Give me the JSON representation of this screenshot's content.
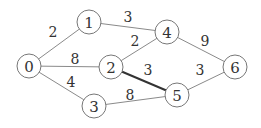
{
  "diagram": {
    "type": "weighted-undirected-graph",
    "nodes": [
      {
        "id": "0",
        "label": "0",
        "x": 29,
        "y": 66
      },
      {
        "id": "1",
        "label": "1",
        "x": 89,
        "y": 22
      },
      {
        "id": "2",
        "label": "2",
        "x": 111,
        "y": 67
      },
      {
        "id": "3",
        "label": "3",
        "x": 94,
        "y": 106
      },
      {
        "id": "4",
        "label": "4",
        "x": 167,
        "y": 32
      },
      {
        "id": "5",
        "label": "5",
        "x": 177,
        "y": 95
      },
      {
        "id": "6",
        "label": "6",
        "x": 235,
        "y": 67
      }
    ],
    "node_radius": 12,
    "edges": [
      {
        "from": "0",
        "to": "1",
        "weight": "2",
        "label_x": 53,
        "label_y": 32,
        "highlighted": false
      },
      {
        "from": "0",
        "to": "2",
        "weight": "8",
        "label_x": 75,
        "label_y": 59,
        "highlighted": false
      },
      {
        "from": "0",
        "to": "3",
        "weight": "4",
        "label_x": 71,
        "label_y": 82,
        "highlighted": false
      },
      {
        "from": "1",
        "to": "4",
        "weight": "3",
        "label_x": 128,
        "label_y": 17,
        "highlighted": false
      },
      {
        "from": "2",
        "to": "4",
        "weight": "2",
        "label_x": 135,
        "label_y": 41,
        "highlighted": false
      },
      {
        "from": "2",
        "to": "5",
        "weight": "3",
        "label_x": 148,
        "label_y": 70,
        "highlighted": true
      },
      {
        "from": "3",
        "to": "5",
        "weight": "8",
        "label_x": 130,
        "label_y": 95,
        "highlighted": false
      },
      {
        "from": "4",
        "to": "6",
        "weight": "9",
        "label_x": 205,
        "label_y": 41,
        "highlighted": false
      },
      {
        "from": "5",
        "to": "6",
        "weight": "3",
        "label_x": 200,
        "label_y": 70,
        "highlighted": false
      }
    ]
  }
}
